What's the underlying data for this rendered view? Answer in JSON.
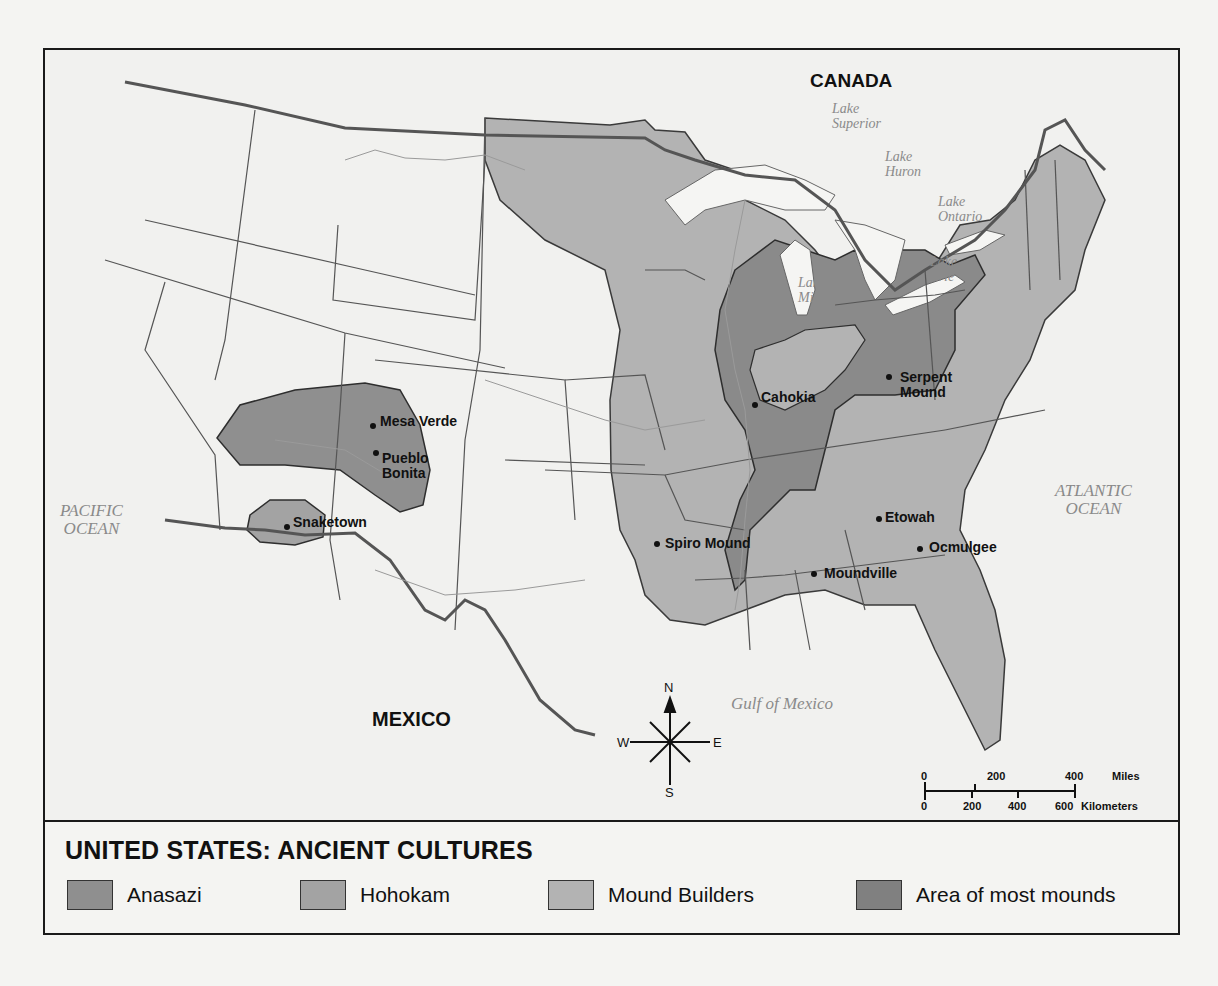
{
  "map": {
    "title": "UNITED STATES: ANCIENT CULTURES",
    "countries": {
      "canada": "CANADA",
      "mexico": "MEXICO"
    },
    "water_bodies": {
      "pacific": [
        "PACIFIC",
        "OCEAN"
      ],
      "atlantic": [
        "ATLANTIC",
        "OCEAN"
      ],
      "gulf": "Gulf of Mexico",
      "lake_superior": [
        "Lake",
        "Superior"
      ],
      "lake_huron": [
        "Lake",
        "Huron"
      ],
      "lake_ontario": [
        "Lake",
        "Ontario"
      ],
      "lake_erie": [
        "Lake",
        "Erie"
      ],
      "lake_michigan": [
        "Lake",
        "Michigan"
      ]
    },
    "sites": [
      {
        "name": "Mesa Verde",
        "culture": "Anasazi"
      },
      {
        "name": "Pueblo Bonita",
        "lines": [
          "Pueblo",
          "Bonita"
        ],
        "culture": "Anasazi"
      },
      {
        "name": "Snaketown",
        "culture": "Hohokam"
      },
      {
        "name": "Cahokia",
        "culture": "Mound Builders"
      },
      {
        "name": "Serpent Mound",
        "lines": [
          "Serpent",
          "Mound"
        ],
        "culture": "Mound Builders"
      },
      {
        "name": "Spiro Mound",
        "culture": "Mound Builders"
      },
      {
        "name": "Etowah",
        "culture": "Mound Builders"
      },
      {
        "name": "Ocmulgee",
        "culture": "Mound Builders"
      },
      {
        "name": "Moundville",
        "culture": "Mound Builders"
      }
    ],
    "compass": {
      "n": "N",
      "s": "S",
      "e": "E",
      "w": "W"
    },
    "scale_bar": {
      "miles_label": "Miles",
      "miles_ticks": [
        "0",
        "200",
        "400"
      ],
      "km_label": "Kilometers",
      "km_ticks": [
        "0",
        "200",
        "400",
        "600"
      ]
    }
  },
  "legend": {
    "items": [
      {
        "label": "Anasazi",
        "color": "#8f8f8f"
      },
      {
        "label": "Hohokam",
        "color": "#a3a3a3"
      },
      {
        "label": "Mound Builders",
        "color": "#b3b3b3"
      },
      {
        "label": "Area of most mounds",
        "color": "#808080"
      }
    ]
  },
  "colors": {
    "land": "#f1f1ef",
    "anasazi": "#8f8f8f",
    "hohokam": "#a3a3a3",
    "mound_builders": "#b3b3b3",
    "most_mounds": "#8a8a8a",
    "lakes": "#f5f5f3",
    "border": "#555555"
  }
}
